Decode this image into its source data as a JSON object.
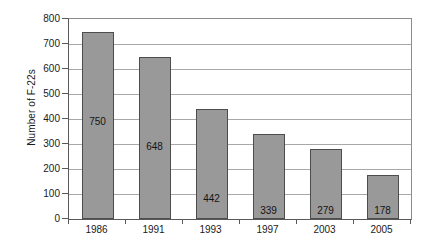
{
  "chart_data": {
    "type": "bar",
    "title": "",
    "subtitle": "",
    "xlabel": "",
    "ylabel": "Number of F-22s",
    "categories": [
      "1986",
      "1991",
      "1993",
      "1997",
      "2003",
      "2005"
    ],
    "values": [
      750,
      648,
      442,
      339,
      279,
      178
    ],
    "data_labels": [
      "750",
      "648",
      "442",
      "339",
      "279",
      "178"
    ],
    "ylim": [
      0,
      800
    ],
    "ytick_interval": 100,
    "ytick_labels": [
      "0",
      "100",
      "200",
      "300",
      "400",
      "500",
      "600",
      "700",
      "800"
    ],
    "grid": "horizontal",
    "legend": "none",
    "series": [
      {
        "name": "Number of F-22s",
        "values": [
          750,
          648,
          442,
          339,
          279,
          178
        ],
        "color": "#999999",
        "border_color": "#4d4d4d"
      }
    ],
    "colors": {
      "bar_fill": "#999999",
      "bar_border": "#4d4d4d",
      "gridline": "#a8a8a8",
      "axis": "#595959",
      "plot_background": "#ffffff",
      "text": "#1a1a1a"
    }
  }
}
